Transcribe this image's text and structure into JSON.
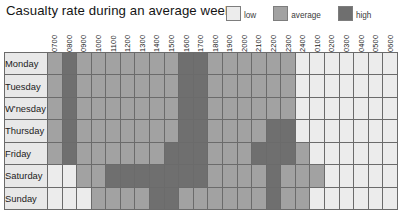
{
  "header": {
    "title": "Casualty rate during an average week"
  },
  "legend": {
    "position": "top-right",
    "entries": [
      {
        "label": "low",
        "key": "low",
        "color": "#ececec"
      },
      {
        "label": "average",
        "key": "average",
        "color": "#a2a2a2"
      },
      {
        "label": "high",
        "key": "high",
        "color": "#6f6f6f"
      }
    ]
  },
  "chart_data": {
    "type": "heatmap",
    "title": "Casualty rate during an average week",
    "xlabel": "",
    "ylabel": "",
    "grid": true,
    "legend_position": "top-right",
    "value_scale": [
      "low",
      "average",
      "high"
    ],
    "value_colors": {
      "low": "#ececec",
      "average": "#a2a2a2",
      "high": "#6f6f6f"
    },
    "categories": [
      "0700",
      "0800",
      "0900",
      "1000",
      "1100",
      "1200",
      "1300",
      "1400",
      "1500",
      "1600",
      "1700",
      "1800",
      "1900",
      "2000",
      "2100",
      "2200",
      "2300",
      "2400",
      "0100",
      "0200",
      "0300",
      "0400",
      "0500",
      "0600"
    ],
    "rows": [
      {
        "label": "Monday",
        "values": [
          "average",
          "high",
          "average",
          "average",
          "average",
          "average",
          "average",
          "average",
          "average",
          "high",
          "high",
          "average",
          "average",
          "average",
          "average",
          "average",
          "average",
          "low",
          "low",
          "low",
          "low",
          "low",
          "low",
          "low"
        ]
      },
      {
        "label": "Tuesday",
        "values": [
          "average",
          "high",
          "average",
          "average",
          "average",
          "average",
          "average",
          "average",
          "average",
          "high",
          "high",
          "average",
          "average",
          "average",
          "average",
          "average",
          "average",
          "low",
          "low",
          "low",
          "low",
          "low",
          "low",
          "low"
        ]
      },
      {
        "label": "W'nesday",
        "values": [
          "average",
          "high",
          "average",
          "average",
          "average",
          "average",
          "average",
          "average",
          "average",
          "high",
          "high",
          "average",
          "average",
          "average",
          "average",
          "average",
          "average",
          "low",
          "low",
          "low",
          "low",
          "low",
          "low",
          "low"
        ]
      },
      {
        "label": "Thursday",
        "values": [
          "average",
          "high",
          "average",
          "average",
          "average",
          "average",
          "average",
          "average",
          "average",
          "high",
          "high",
          "average",
          "average",
          "average",
          "average",
          "high",
          "high",
          "low",
          "low",
          "low",
          "low",
          "low",
          "low",
          "low"
        ]
      },
      {
        "label": "Friday",
        "values": [
          "average",
          "high",
          "average",
          "average",
          "average",
          "average",
          "average",
          "average",
          "high",
          "high",
          "high",
          "average",
          "average",
          "average",
          "high",
          "high",
          "high",
          "average",
          "low",
          "low",
          "low",
          "low",
          "low",
          "low"
        ]
      },
      {
        "label": "Saturday",
        "values": [
          "low",
          "low",
          "average",
          "average",
          "high",
          "high",
          "high",
          "high",
          "high",
          "high",
          "high",
          "average",
          "average",
          "average",
          "average",
          "high",
          "average",
          "average",
          "average",
          "low",
          "low",
          "low",
          "low",
          "low"
        ]
      },
      {
        "label": "Sunday",
        "values": [
          "low",
          "low",
          "low",
          "average",
          "average",
          "average",
          "average",
          "high",
          "high",
          "average",
          "average",
          "average",
          "average",
          "average",
          "average",
          "high",
          "average",
          "average",
          "low",
          "low",
          "low",
          "low",
          "low",
          "low"
        ]
      }
    ]
  }
}
